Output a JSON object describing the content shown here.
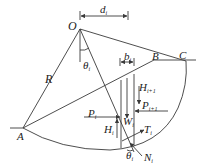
{
  "colors": {
    "line": "#3a3a3a",
    "text": "#222222",
    "background": "#ffffff"
  },
  "points": {
    "O": "O",
    "A": "A",
    "B": "B",
    "C": "C"
  },
  "labels": {
    "R": "R",
    "d": "d",
    "d_sub": "i",
    "b": "b",
    "b_sub": "i",
    "theta_top": "θ",
    "theta_top_sub": "i",
    "H_next": "H",
    "H_next_sub": "i+1",
    "P_next": "P",
    "P_next_sub": "i+1",
    "P": "P",
    "P_sub": "i",
    "H": "H",
    "H_sub": "i",
    "W": "W",
    "W_sub": "i",
    "T": "T",
    "T_sub": "i",
    "theta_bottom": "θ",
    "theta_bottom_sub": "i",
    "N": "N",
    "N_sub": "i"
  }
}
